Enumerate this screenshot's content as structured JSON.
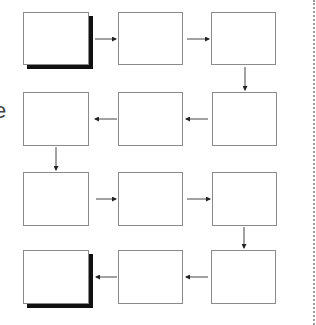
{
  "diagram": {
    "type": "flowchart",
    "layout": "serpentine 4x3 grid",
    "side_label": "e",
    "colors": {
      "box_border": "#8a8a8a",
      "shadow": "#111111",
      "arrow": "#333333",
      "divider": "#9a9a9a"
    },
    "boxes": [
      {
        "id": "b1",
        "row": 1,
        "col": 1,
        "label": "",
        "shadow": true,
        "x": 23,
        "y": 12,
        "w": 66,
        "h": 53
      },
      {
        "id": "b2",
        "row": 1,
        "col": 2,
        "label": "",
        "shadow": false,
        "x": 118,
        "y": 12,
        "w": 65,
        "h": 53
      },
      {
        "id": "b3",
        "row": 1,
        "col": 3,
        "label": "",
        "shadow": false,
        "x": 211,
        "y": 12,
        "w": 65,
        "h": 53
      },
      {
        "id": "b4",
        "row": 2,
        "col": 1,
        "label": "",
        "shadow": false,
        "x": 23,
        "y": 92,
        "w": 66,
        "h": 54
      },
      {
        "id": "b5",
        "row": 2,
        "col": 2,
        "label": "",
        "shadow": false,
        "x": 118,
        "y": 92,
        "w": 65,
        "h": 54
      },
      {
        "id": "b6",
        "row": 2,
        "col": 3,
        "label": "",
        "shadow": false,
        "x": 212,
        "y": 92,
        "w": 65,
        "h": 54
      },
      {
        "id": "b7",
        "row": 3,
        "col": 1,
        "label": "",
        "shadow": false,
        "x": 23,
        "y": 172,
        "w": 66,
        "h": 54
      },
      {
        "id": "b8",
        "row": 3,
        "col": 2,
        "label": "",
        "shadow": false,
        "x": 118,
        "y": 172,
        "w": 65,
        "h": 54
      },
      {
        "id": "b9",
        "row": 3,
        "col": 3,
        "label": "",
        "shadow": false,
        "x": 212,
        "y": 172,
        "w": 65,
        "h": 54
      },
      {
        "id": "b10",
        "row": 4,
        "col": 1,
        "label": "",
        "shadow": true,
        "x": 23,
        "y": 250,
        "w": 66,
        "h": 54
      },
      {
        "id": "b11",
        "row": 4,
        "col": 2,
        "label": "",
        "shadow": false,
        "x": 118,
        "y": 250,
        "w": 65,
        "h": 54
      },
      {
        "id": "b12",
        "row": 4,
        "col": 3,
        "label": "",
        "shadow": false,
        "x": 211,
        "y": 250,
        "w": 65,
        "h": 54
      }
    ],
    "edges": [
      {
        "from": "b1",
        "to": "b2",
        "direction": "right"
      },
      {
        "from": "b2",
        "to": "b3",
        "direction": "right"
      },
      {
        "from": "b3",
        "to": "b6",
        "direction": "down"
      },
      {
        "from": "b6",
        "to": "b5",
        "direction": "left"
      },
      {
        "from": "b5",
        "to": "b4",
        "direction": "left"
      },
      {
        "from": "b4",
        "to": "b7",
        "direction": "down"
      },
      {
        "from": "b7",
        "to": "b8",
        "direction": "right"
      },
      {
        "from": "b8",
        "to": "b9",
        "direction": "right"
      },
      {
        "from": "b9",
        "to": "b12",
        "direction": "down"
      },
      {
        "from": "b12",
        "to": "b11",
        "direction": "left"
      },
      {
        "from": "b11",
        "to": "b10",
        "direction": "left"
      }
    ]
  }
}
